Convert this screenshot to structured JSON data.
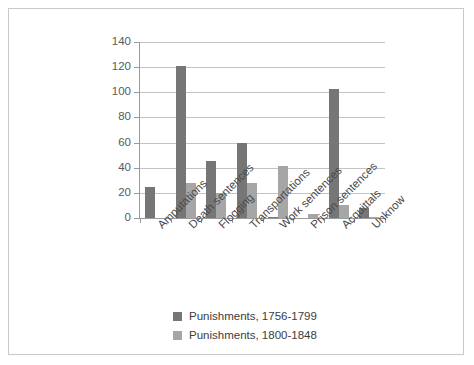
{
  "chart_data": {
    "type": "bar",
    "title": "",
    "subtitle": "",
    "xlabel": "",
    "ylabel": "",
    "ylim": [
      0,
      140
    ],
    "ytick_labels": [
      "140",
      "120",
      "100",
      "80",
      "60",
      "40",
      "20",
      "0"
    ],
    "ytick_values": [
      140,
      120,
      100,
      80,
      60,
      40,
      20,
      0
    ],
    "grid": true,
    "legend_position": "bottom-center",
    "categories": [
      "Amputations",
      "Death sentences",
      "Flogging",
      "Transportations",
      "Work sentences",
      "Prison sentences",
      "Acquittals",
      "Unknow"
    ],
    "series": [
      {
        "name": "Punishments, 1756-1799",
        "color": "#767676",
        "values": [
          25,
          121,
          45,
          60,
          1,
          0,
          103,
          8
        ]
      },
      {
        "name": "Punishments, 1800-1848",
        "color": "#a6a6a6",
        "values": [
          0,
          28,
          20,
          28,
          41,
          3,
          10,
          1
        ]
      }
    ]
  },
  "frame": {
    "border_color": "#c9c9c9",
    "background": "#ffffff"
  },
  "axis": {
    "line_color": "#9a9a9a",
    "gridline_color": "#c4c4c4"
  }
}
